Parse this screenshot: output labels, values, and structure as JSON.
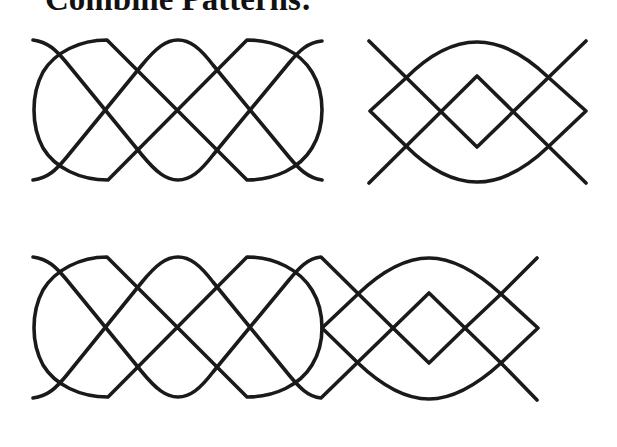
{
  "title": "Combine Patterns:",
  "colors": {
    "stroke": "#1a1a1a",
    "background": "#ffffff"
  },
  "figures": [
    {
      "id": "pattern-a",
      "description": "Interlaced wave strands with figure-eight chain loop",
      "position": "top-left"
    },
    {
      "id": "pattern-b",
      "description": "Crossing diagonals with central diamond and lens-shaped arc",
      "position": "top-right"
    },
    {
      "id": "pattern-combined",
      "description": "Pattern A joined to Pattern B into a single border",
      "position": "bottom"
    }
  ]
}
